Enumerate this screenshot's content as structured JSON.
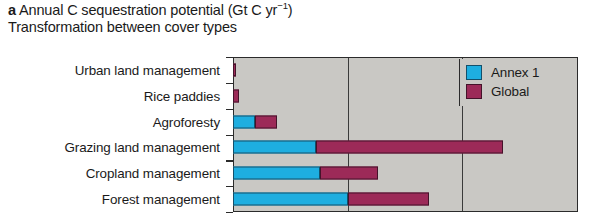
{
  "figure": {
    "panel_letter": "a",
    "title_line_1_pre": "Annual C sequestration potential (Gt C yr",
    "title_superscript": "−1",
    "title_line_1_post": ")",
    "title_line_2": "Transformation between cover types"
  },
  "legend": {
    "position": "top-right",
    "entries": [
      {
        "label": "Annex 1",
        "color": "#1eaee0",
        "swatch_name": "legend-swatch-annex-1"
      },
      {
        "label": "Global",
        "color": "#9c2a58",
        "swatch_name": "legend-swatch-global"
      }
    ]
  },
  "colors": {
    "annex_1": "#1eaee0",
    "global": "#9c2a58",
    "plot_background": "#c9c8c4",
    "axis": "#2b2b2b",
    "text": "#1a1a1a"
  },
  "chart_data": {
    "type": "bar",
    "orientation": "horizontal",
    "stacked": true,
    "title": "a Annual C sequestration potential (Gt C yr−1)",
    "subtitle": "Transformation between cover types",
    "xlabel": "",
    "ylabel": "",
    "xlim": [
      0,
      3
    ],
    "xticks": [
      0,
      1,
      2,
      3
    ],
    "xtick_labels": [
      "",
      "",
      "",
      ""
    ],
    "grid": true,
    "grid_axis": "x",
    "legend_position": "top-right",
    "categories": [
      "Urban land management",
      "Rice paddies",
      "Agroforesty",
      "Grazing land management",
      "Cropland management",
      "Forest management"
    ],
    "series": [
      {
        "name": "Annex 1",
        "color": "#1eaee0",
        "values": [
          0.0,
          0.0,
          0.19,
          0.72,
          0.76,
          1.0
        ]
      },
      {
        "name": "Global",
        "color": "#9c2a58",
        "values": [
          0.03,
          0.05,
          0.19,
          1.63,
          0.5,
          0.7
        ]
      }
    ]
  }
}
